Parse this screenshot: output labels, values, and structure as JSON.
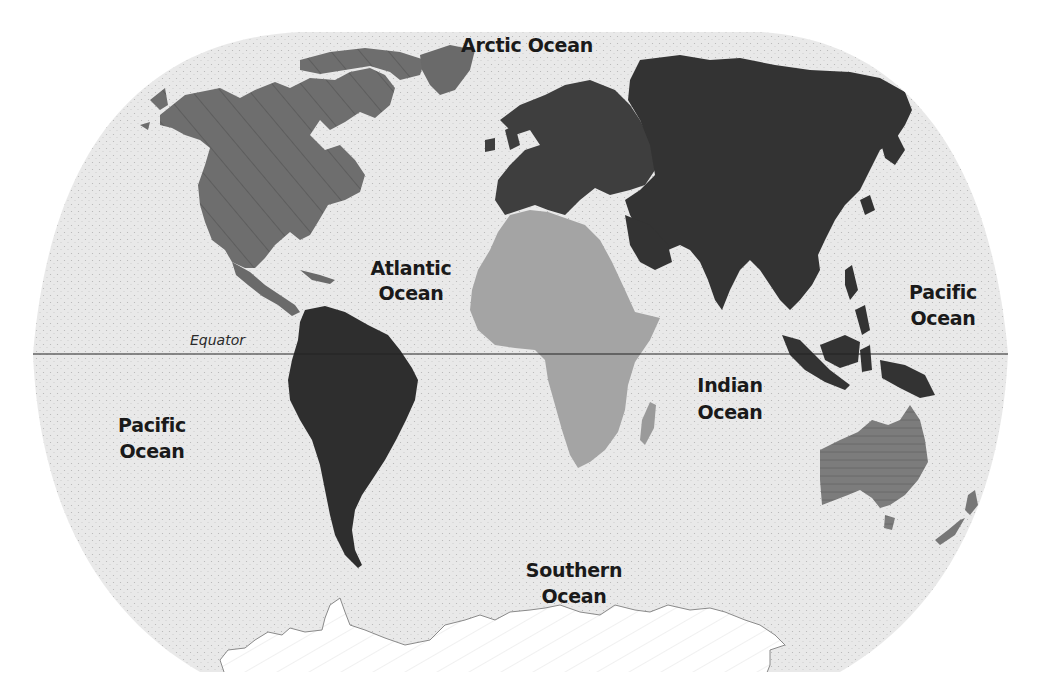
{
  "map": {
    "title": "World Oceans",
    "projection": "robinson-like",
    "colors": {
      "ocean": "#e8e8e8",
      "ocean_stipple": "#b8b8b8",
      "north_america": "#707070",
      "south_america": "#2e2e2e",
      "europe": "#404040",
      "asia": "#333333",
      "africa": "#a4a4a4",
      "australia": "#7a7a7a",
      "antarctica": "#ffffff",
      "equator_line": "#222222"
    },
    "labels": {
      "arctic": "Arctic Ocean",
      "atlantic_line1": "Atlantic",
      "atlantic_line2": "Ocean",
      "pacific_east_line1": "Pacific",
      "pacific_east_line2": "Ocean",
      "pacific_west_line1": "Pacific",
      "pacific_west_line2": "Ocean",
      "indian_line1": "Indian",
      "indian_line2": "Ocean",
      "southern_line1": "Southern",
      "southern_line2": "Ocean",
      "equator": "Equator"
    },
    "continents": [
      "North America",
      "South America",
      "Europe",
      "Asia",
      "Africa",
      "Australia",
      "Antarctica"
    ]
  }
}
